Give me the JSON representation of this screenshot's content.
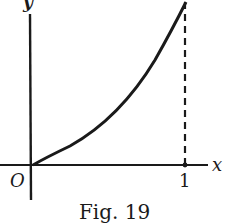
{
  "figure": {
    "caption": "Fig. 19",
    "labels": {
      "y_axis": "y",
      "x_axis": "x",
      "origin": "O",
      "tick_one": "1"
    },
    "colors": {
      "ink": "#1a1a1a",
      "background": "#ffffff"
    },
    "elements": {
      "curve": "increasing convex curve from origin to x = 1",
      "dashed_line": "vertical dashed line at x = 1"
    }
  }
}
